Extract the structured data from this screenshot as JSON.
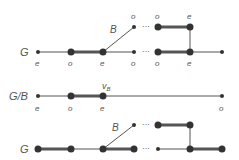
{
  "diagrams": [
    {
      "label": "G",
      "bottom_labels": [
        "e",
        "o",
        "e",
        "o",
        "o",
        "e"
      ],
      "top_labels": [
        "o",
        "o",
        "e"
      ],
      "edge_label": "B",
      "ellipsis": "···"
    },
    {
      "label": "G/B",
      "bottom_labels": [
        "e",
        "o",
        "e",
        "o"
      ],
      "vertex_label": "v",
      "vertex_sub": "B"
    },
    {
      "label": "G",
      "edge_label": "B",
      "ellipsis": "···"
    }
  ],
  "colors": {
    "line": "#555555",
    "node": "#333333",
    "text": "#555555"
  }
}
